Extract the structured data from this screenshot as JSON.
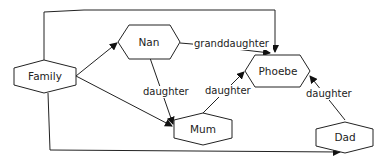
{
  "diagram": {
    "type": "family-relationship-graph",
    "nodes": {
      "family": "Family",
      "nan": "Nan",
      "phoebe": "Phoebe",
      "mum": "Mum",
      "dad": "Dad"
    },
    "edges": [
      {
        "from": "Family",
        "to": "Nan",
        "label": ""
      },
      {
        "from": "Family",
        "to": "Mum",
        "label": ""
      },
      {
        "from": "Family",
        "to": "Phoebe",
        "label": ""
      },
      {
        "from": "Family",
        "to": "Dad",
        "label": ""
      },
      {
        "from": "Nan",
        "to": "Phoebe",
        "label": "granddaughter"
      },
      {
        "from": "Nan",
        "to": "Mum",
        "label": "daughter"
      },
      {
        "from": "Mum",
        "to": "Phoebe",
        "label": "daughter"
      },
      {
        "from": "Dad",
        "to": "Phoebe",
        "label": "daughter"
      }
    ],
    "edge_labels": {
      "nan_phoebe": "granddaughter",
      "nan_mum": "daughter",
      "mum_phoebe": "daughter",
      "dad_phoebe": "daughter"
    }
  }
}
